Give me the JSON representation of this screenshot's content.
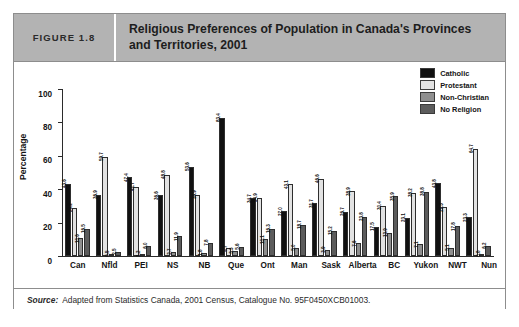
{
  "figure": {
    "number_label": "FIGURE 1.8",
    "title": "Religious Preferences of Population in Canada's Provinces and Territories, 2001",
    "source_word": "Source:",
    "source_text": "Adapted from Statistics Canada, 2001 Census, Catalogue No. 95F0450XCB01003."
  },
  "colors": {
    "header_bg": "#b3b3b3",
    "catholic": "#111111",
    "protestant": "#e2e2e2",
    "non_christian": "#8f8f8f",
    "no_religion": "#5c5c5c",
    "border": "#8d8d8d"
  },
  "chart_data": {
    "type": "bar",
    "title": "Religious Preferences of Population in Canada's Provinces and Territories, 2001",
    "xlabel": "",
    "ylabel": "Percentage",
    "ylim": [
      0,
      100
    ],
    "yticks": [
      0,
      20,
      40,
      60,
      80,
      100
    ],
    "grid": false,
    "legend_position": "top-right",
    "categories": [
      "Can",
      "Nfld",
      "PEI",
      "NS",
      "NB",
      "Que",
      "Ont",
      "Man",
      "Sask",
      "Alberta",
      "BC",
      "Yukon",
      "NWT",
      "Nun"
    ],
    "series": [
      {
        "name": "Catholic",
        "color": "#111111",
        "values": [
          43.6,
          36.9,
          47.4,
          36.6,
          53.6,
          83.4,
          34.7,
          27.0,
          31.7,
          26.7,
          17.5,
          23.1,
          43.8,
          23.3
        ]
      },
      {
        "name": "Protestant",
        "color": "#e2e2e2",
        "values": [
          29.2,
          59.7,
          41.7,
          48.8,
          36.9,
          4.7,
          34.9,
          43.1,
          46.6,
          38.9,
          30.4,
          38.2,
          29.3,
          64.7
        ]
      },
      {
        "name": "Non-Christian",
        "color": "#8f8f8f",
        "values": [
          10.6,
          0.5,
          1.2,
          2.7,
          1.8,
          3.3,
          10.1,
          5.0,
          3.9,
          7.6,
          13.9,
          7.1,
          5.1,
          0.8
        ]
      },
      {
        "name": "No Religion",
        "color": "#5c5c5c",
        "values": [
          16.5,
          2.5,
          6.0,
          11.9,
          7.8,
          5.6,
          16.3,
          18.7,
          15.2,
          23.8,
          35.9,
          38.8,
          17.8,
          6.2
        ]
      }
    ]
  }
}
